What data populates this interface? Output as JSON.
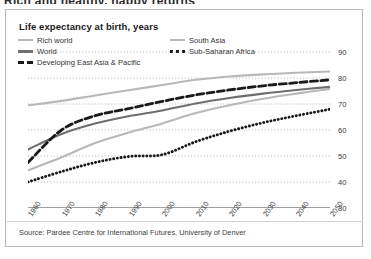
{
  "headline_fragment": "Rich and healthy, happy returns",
  "card": {
    "title": "Life expectancy at birth, years",
    "source": "Source: Pardee Centre for International Futures, University of Denver"
  },
  "legend": {
    "items": [
      {
        "label": "Rich world",
        "style": "solid",
        "color": "#b8b8b8",
        "key": "rich"
      },
      {
        "label": "World",
        "style": "solid",
        "color": "#6e6e6e",
        "key": "world"
      },
      {
        "label": "Developing East Asia & Pacific",
        "style": "dashed",
        "color": "#1a1a1a",
        "key": "deap"
      },
      {
        "label": "South Asia",
        "style": "solid",
        "color": "#b8b8b8",
        "key": "south"
      },
      {
        "label": "Sub-Saharan Africa",
        "style": "dotted",
        "color": "#1a1a1a",
        "key": "ssa"
      }
    ]
  },
  "chart_data": {
    "type": "line",
    "title": "Life expectancy at birth, years",
    "xlabel": "",
    "ylabel": "years",
    "ylim": [
      30,
      90
    ],
    "xlim": [
      1960,
      2050
    ],
    "yticks": [
      30,
      40,
      50,
      60,
      70,
      80,
      90
    ],
    "xticks": [
      1960,
      1970,
      1980,
      1990,
      2000,
      2010,
      2020,
      2030,
      2040,
      2050
    ],
    "y_axis_position": "right",
    "grid": "horizontal-dotted",
    "legend_position": "top",
    "x": [
      1960,
      1970,
      1980,
      1990,
      2000,
      2010,
      2020,
      2030,
      2040,
      2050
    ],
    "series": [
      {
        "name": "Rich world",
        "color": "#b8b8b8",
        "style": "solid",
        "values": [
          69.5,
          71.2,
          73.3,
          75.3,
          77.3,
          79.3,
          80.6,
          81.4,
          82.0,
          82.5
        ]
      },
      {
        "name": "World",
        "color": "#6e6e6e",
        "style": "solid",
        "values": [
          52.5,
          58.5,
          62.5,
          65.3,
          67.5,
          70.2,
          72.3,
          74.0,
          75.4,
          76.6
        ]
      },
      {
        "name": "Developing East Asia & Pacific",
        "color": "#1a1a1a",
        "style": "dashed",
        "values": [
          47.5,
          60.0,
          65.5,
          68.2,
          71.0,
          73.5,
          75.4,
          77.0,
          78.2,
          79.3
        ]
      },
      {
        "name": "South Asia",
        "color": "#b8b8b8",
        "style": "solid",
        "values": [
          44.5,
          49.5,
          55.0,
          59.0,
          62.5,
          66.5,
          69.5,
          72.0,
          74.0,
          75.8
        ]
      },
      {
        "name": "Sub-Saharan Africa",
        "color": "#1a1a1a",
        "style": "dotted",
        "values": [
          40.0,
          44.0,
          47.5,
          49.8,
          50.5,
          55.5,
          59.5,
          62.8,
          65.5,
          68.0
        ]
      }
    ]
  }
}
